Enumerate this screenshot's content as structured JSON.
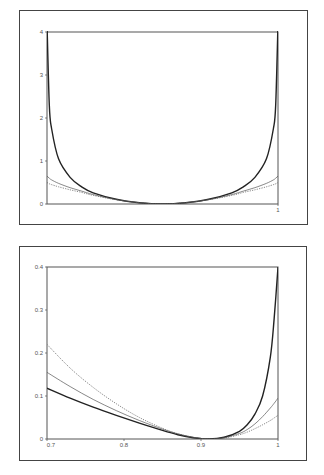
{
  "chart_data": [
    {
      "type": "line",
      "title": "",
      "xlabel": "",
      "ylabel": "",
      "xlim": [
        0,
        1
      ],
      "ylim": [
        0,
        4
      ],
      "grid": false,
      "legend": null,
      "x_ticks": [
        {
          "value": 1,
          "label": "1"
        }
      ],
      "y_ticks": [
        {
          "value": 0,
          "label": "0"
        },
        {
          "value": 1,
          "label": "1"
        },
        {
          "value": 2,
          "label": "2"
        },
        {
          "value": 3,
          "label": "3"
        },
        {
          "value": 4,
          "label": "4"
        }
      ],
      "x": [
        0,
        0.01,
        0.02,
        0.05,
        0.1,
        0.15,
        0.2,
        0.3,
        0.4,
        0.5,
        0.6,
        0.7,
        0.8,
        0.85,
        0.9,
        0.95,
        0.98,
        0.99,
        1
      ],
      "series": [
        {
          "name": "thick-solid",
          "style": "solid",
          "width": 1.4,
          "color": "#222222",
          "values": [
            4.2,
            2.3,
            1.75,
            1.05,
            0.62,
            0.4,
            0.26,
            0.11,
            0.03,
            0.0,
            0.03,
            0.11,
            0.26,
            0.4,
            0.62,
            1.05,
            1.75,
            2.3,
            4.2
          ]
        },
        {
          "name": "thin-solid",
          "style": "solid",
          "width": 0.7,
          "color": "#555555",
          "values": [
            0.65,
            0.6,
            0.56,
            0.48,
            0.38,
            0.3,
            0.22,
            0.1,
            0.03,
            0.0,
            0.03,
            0.1,
            0.22,
            0.3,
            0.38,
            0.48,
            0.56,
            0.6,
            0.65
          ]
        },
        {
          "name": "dotted",
          "style": "dotted",
          "width": 0.7,
          "color": "#555555",
          "values": [
            0.5,
            0.47,
            0.45,
            0.4,
            0.33,
            0.27,
            0.2,
            0.1,
            0.03,
            0.0,
            0.03,
            0.1,
            0.2,
            0.27,
            0.33,
            0.4,
            0.45,
            0.47,
            0.5
          ]
        }
      ]
    },
    {
      "type": "line",
      "title": "",
      "xlabel": "",
      "ylabel": "",
      "xlim": [
        0.7,
        1
      ],
      "ylim": [
        0,
        0.4
      ],
      "grid": false,
      "legend": null,
      "x_ticks": [
        {
          "value": 0.7,
          "label": "0.7"
        },
        {
          "value": 0.8,
          "label": "0.8"
        },
        {
          "value": 0.9,
          "label": "0.9"
        },
        {
          "value": 1,
          "label": "1"
        }
      ],
      "y_ticks": [
        {
          "value": 0,
          "label": "0"
        },
        {
          "value": 0.1,
          "label": "0.1"
        },
        {
          "value": 0.2,
          "label": "0.2"
        },
        {
          "value": 0.3,
          "label": "0.3"
        },
        {
          "value": 0.4,
          "label": "0.4"
        }
      ],
      "x": [
        0.7,
        0.73,
        0.76,
        0.79,
        0.82,
        0.85,
        0.87,
        0.89,
        0.91,
        0.93,
        0.95,
        0.96,
        0.97,
        0.98,
        0.99,
        0.995,
        1
      ],
      "series": [
        {
          "name": "thick-solid",
          "style": "solid",
          "width": 1.4,
          "color": "#222222",
          "values": [
            0.118,
            0.095,
            0.074,
            0.055,
            0.037,
            0.02,
            0.01,
            0.003,
            0.0,
            0.004,
            0.018,
            0.033,
            0.058,
            0.1,
            0.19,
            0.28,
            0.4
          ]
        },
        {
          "name": "thin-solid",
          "style": "solid",
          "width": 0.7,
          "color": "#555555",
          "values": [
            0.155,
            0.122,
            0.092,
            0.066,
            0.043,
            0.023,
            0.012,
            0.004,
            0.0,
            0.003,
            0.013,
            0.022,
            0.035,
            0.052,
            0.072,
            0.083,
            0.095
          ]
        },
        {
          "name": "dotted",
          "style": "dotted",
          "width": 0.7,
          "color": "#555555",
          "values": [
            0.22,
            0.165,
            0.12,
            0.082,
            0.05,
            0.025,
            0.012,
            0.004,
            0.0,
            0.002,
            0.01,
            0.016,
            0.024,
            0.033,
            0.043,
            0.049,
            0.055
          ]
        }
      ]
    }
  ]
}
